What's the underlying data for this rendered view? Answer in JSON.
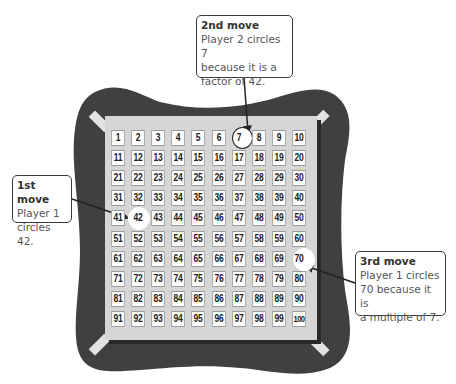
{
  "board": {
    "numbers": [
      "1",
      "2",
      "3",
      "4",
      "5",
      "6",
      "7",
      "8",
      "9",
      "10",
      "11",
      "12",
      "13",
      "14",
      "15",
      "16",
      "17",
      "18",
      "19",
      "20",
      "21",
      "22",
      "23",
      "24",
      "25",
      "26",
      "27",
      "28",
      "29",
      "30",
      "31",
      "32",
      "33",
      "34",
      "35",
      "36",
      "37",
      "38",
      "39",
      "40",
      "41",
      "42",
      "43",
      "44",
      "45",
      "46",
      "47",
      "48",
      "49",
      "50",
      "51",
      "52",
      "53",
      "54",
      "55",
      "56",
      "57",
      "58",
      "59",
      "60",
      "61",
      "62",
      "63",
      "64",
      "65",
      "66",
      "67",
      "68",
      "69",
      "70",
      "71",
      "72",
      "73",
      "74",
      "75",
      "76",
      "77",
      "78",
      "79",
      "80",
      "81",
      "82",
      "83",
      "84",
      "85",
      "86",
      "87",
      "88",
      "89",
      "90",
      "91",
      "92",
      "93",
      "94",
      "95",
      "96",
      "97",
      "98",
      "99",
      "100"
    ],
    "circled": [
      "7",
      "42",
      "70"
    ],
    "colors": {
      "frame": "#404040",
      "panel": "#d6d6d6",
      "cell_bg": "#ffffff",
      "cell_border": "#9a9a9a",
      "corner_tabs": "#e2e2e2"
    }
  },
  "callouts": {
    "first": {
      "title": "1st move",
      "body": "Player 1\ncircles 42."
    },
    "second": {
      "title": "2nd move",
      "body": "Player 2 circles 7\nbecause it is a\nfactor of 42."
    },
    "third": {
      "title": "3rd move",
      "body": "Player 1 circles\n70 because it is\na multiple of 7."
    }
  }
}
